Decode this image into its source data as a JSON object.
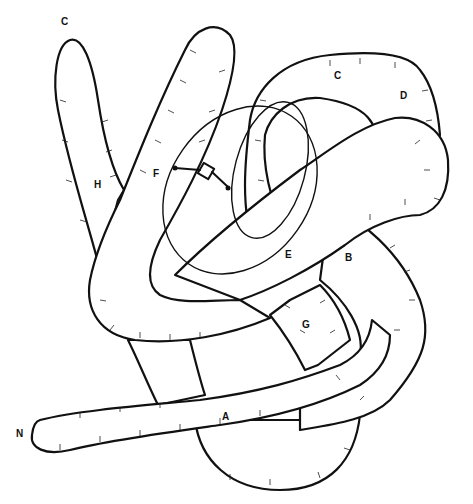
{
  "figure": {
    "stroke_color": "#111111",
    "background_color": "#ffffff"
  },
  "labels": [
    {
      "id": "C-top-left",
      "text": "C",
      "x": 61,
      "y": 22
    },
    {
      "id": "C-top-right",
      "text": "C",
      "x": 334,
      "y": 76
    },
    {
      "id": "D",
      "text": "D",
      "x": 400,
      "y": 96
    },
    {
      "id": "H",
      "text": "H",
      "x": 94,
      "y": 185
    },
    {
      "id": "F",
      "text": "F",
      "x": 153,
      "y": 174
    },
    {
      "id": "E",
      "text": "E",
      "x": 285,
      "y": 255
    },
    {
      "id": "B",
      "text": "B",
      "x": 345,
      "y": 258
    },
    {
      "id": "G",
      "text": "G",
      "x": 302,
      "y": 325
    },
    {
      "id": "A",
      "text": "A",
      "x": 222,
      "y": 417
    },
    {
      "id": "N",
      "text": "N",
      "x": 16,
      "y": 434
    }
  ]
}
